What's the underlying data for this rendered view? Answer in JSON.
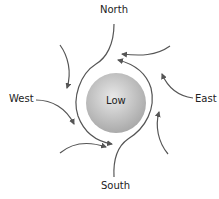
{
  "diagram": {
    "center_label": "Low",
    "labels": {
      "north": "North",
      "south": "South",
      "east": "East",
      "west": "West"
    },
    "colors": {
      "arrow": "#555555",
      "sphere_light": "#e6e6e6",
      "sphere_dark": "#a8a8a8",
      "text": "#222222"
    }
  }
}
